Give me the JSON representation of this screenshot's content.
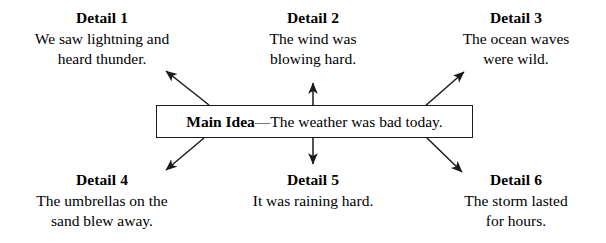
{
  "diagram": {
    "type": "main-idea-and-details-web",
    "background_color": "#ffffff",
    "line_color": "#1a1a1a",
    "main_idea": {
      "label": "Main Idea",
      "separator": "—",
      "statement": "The weather was bad today."
    },
    "details": [
      {
        "id": "detail-1",
        "title": "Detail 1",
        "lines": [
          "We saw lightning and",
          "heard thunder."
        ],
        "position": "top-left",
        "arrow": "up-left"
      },
      {
        "id": "detail-2",
        "title": "Detail 2",
        "lines": [
          "The wind was",
          "blowing hard."
        ],
        "position": "top-center",
        "arrow": "up"
      },
      {
        "id": "detail-3",
        "title": "Detail 3",
        "lines": [
          "The ocean waves",
          "were wild."
        ],
        "position": "top-right",
        "arrow": "up-right"
      },
      {
        "id": "detail-4",
        "title": "Detail 4",
        "lines": [
          "The umbrellas on the",
          "sand blew away."
        ],
        "position": "bottom-left",
        "arrow": "down-left"
      },
      {
        "id": "detail-5",
        "title": "Detail 5",
        "lines": [
          "It was raining hard.",
          ""
        ],
        "position": "bottom-center",
        "arrow": "down"
      },
      {
        "id": "detail-6",
        "title": "Detail 6",
        "lines": [
          "The storm lasted",
          "for hours."
        ],
        "position": "bottom-right",
        "arrow": "down-right"
      }
    ]
  }
}
